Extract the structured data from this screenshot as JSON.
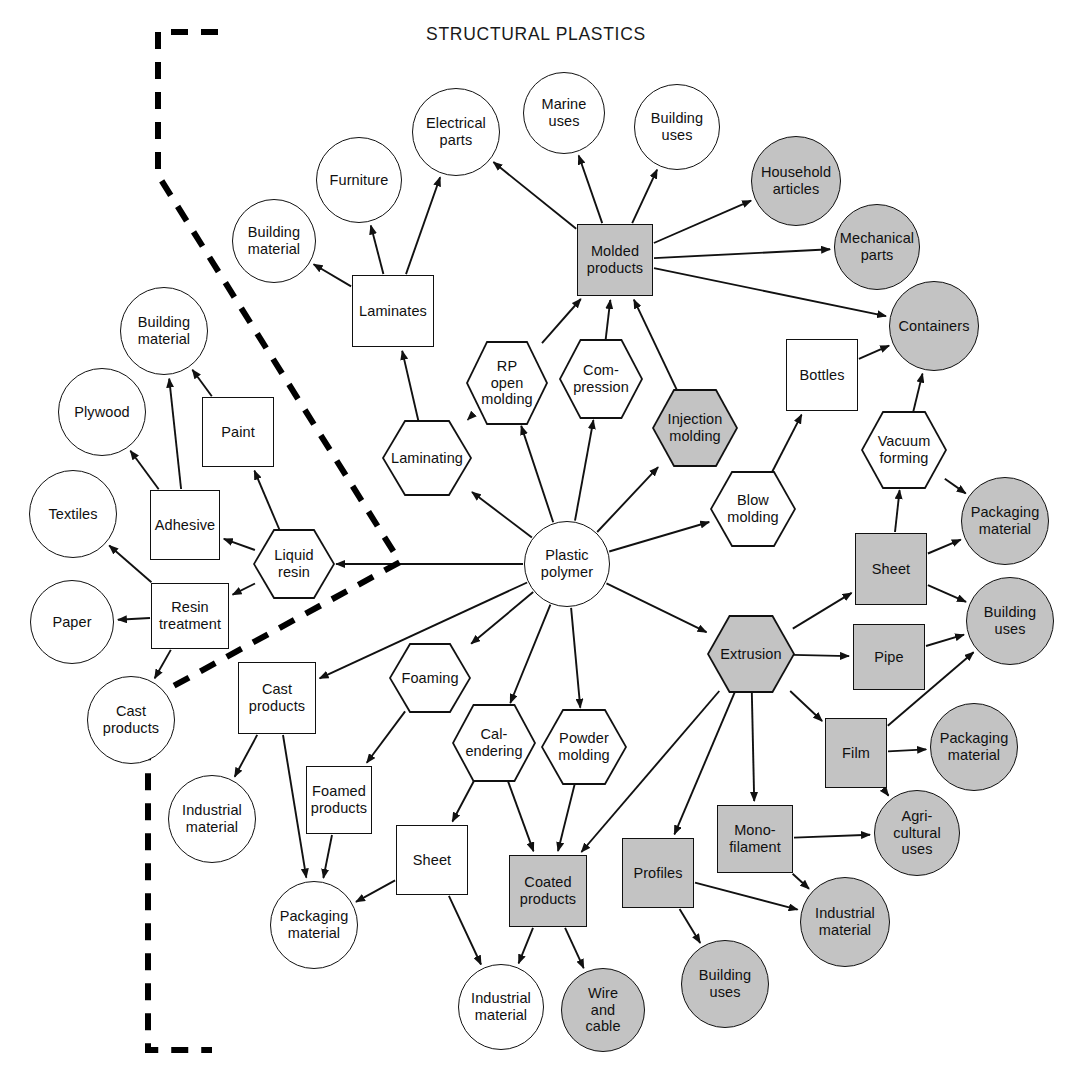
{
  "title": "STRUCTURAL PLASTICS",
  "colors": {
    "shaded_fill": "#c3c3c3",
    "plain_fill": "#ffffff",
    "stroke": "#111111",
    "boundary": "#000000"
  },
  "legend": {
    "shape_meanings": {
      "circle": "end use / application",
      "rectangle": "product form",
      "hexagon": "process"
    },
    "dashed_boundary_label": "dashed boundary line"
  },
  "nodes": [
    {
      "id": "building-material-top",
      "label": "Building\nmaterial",
      "shape": "circle",
      "shaded": false,
      "x": 232,
      "y": 199,
      "w": 84,
      "h": 84
    },
    {
      "id": "furniture",
      "label": "Furniture",
      "shape": "circle",
      "shaded": false,
      "x": 316,
      "y": 137,
      "w": 86,
      "h": 86
    },
    {
      "id": "electrical-parts",
      "label": "Electrical\nparts",
      "shape": "circle",
      "shaded": false,
      "x": 412,
      "y": 88,
      "w": 88,
      "h": 88
    },
    {
      "id": "marine-uses",
      "label": "Marine\nuses",
      "shape": "circle",
      "shaded": false,
      "x": 523,
      "y": 72,
      "w": 82,
      "h": 82
    },
    {
      "id": "building-uses-top",
      "label": "Building\nuses",
      "shape": "circle",
      "shaded": false,
      "x": 634,
      "y": 84,
      "w": 86,
      "h": 86
    },
    {
      "id": "household-articles",
      "label": "Household\narticles",
      "shape": "circle",
      "shaded": true,
      "x": 751,
      "y": 136,
      "w": 90,
      "h": 90
    },
    {
      "id": "mechanical-parts",
      "label": "Mechanical\nparts",
      "shape": "circle",
      "shaded": true,
      "x": 834,
      "y": 204,
      "w": 86,
      "h": 86
    },
    {
      "id": "containers",
      "label": "Containers",
      "shape": "circle",
      "shaded": true,
      "x": 889,
      "y": 281,
      "w": 90,
      "h": 90
    },
    {
      "id": "laminates",
      "label": "Laminates",
      "shape": "rect",
      "shaded": false,
      "x": 352,
      "y": 275,
      "w": 82,
      "h": 72
    },
    {
      "id": "molded-products",
      "label": "Molded\nproducts",
      "shape": "rect",
      "shaded": true,
      "x": 577,
      "y": 224,
      "w": 76,
      "h": 72
    },
    {
      "id": "bottles",
      "label": "Bottles",
      "shape": "rect",
      "shaded": false,
      "x": 786,
      "y": 339,
      "w": 72,
      "h": 72
    },
    {
      "id": "rp-open-molding",
      "label": "RP\nopen\nmolding",
      "shape": "hex",
      "shaded": false,
      "x": 466,
      "y": 341,
      "w": 82,
      "h": 84
    },
    {
      "id": "compression",
      "label": "Com-\npression",
      "shape": "hex",
      "shaded": false,
      "x": 559,
      "y": 339,
      "w": 84,
      "h": 80
    },
    {
      "id": "injection-molding",
      "label": "Injection\nmolding",
      "shape": "hex",
      "shaded": true,
      "x": 652,
      "y": 389,
      "w": 86,
      "h": 78
    },
    {
      "id": "laminating",
      "label": "Laminating",
      "shape": "hex",
      "shaded": false,
      "x": 382,
      "y": 420,
      "w": 90,
      "h": 76
    },
    {
      "id": "blow-molding",
      "label": "Blow\nmolding",
      "shape": "hex",
      "shaded": false,
      "x": 710,
      "y": 471,
      "w": 86,
      "h": 76
    },
    {
      "id": "vacuum-forming",
      "label": "Vacuum\nforming",
      "shape": "hex",
      "shaded": false,
      "x": 861,
      "y": 411,
      "w": 86,
      "h": 78
    },
    {
      "id": "building-material-left",
      "label": "Building\nmaterial",
      "shape": "circle",
      "shaded": false,
      "x": 120,
      "y": 287,
      "w": 88,
      "h": 88
    },
    {
      "id": "plywood",
      "label": "Plywood",
      "shape": "circle",
      "shaded": false,
      "x": 58,
      "y": 368,
      "w": 88,
      "h": 88
    },
    {
      "id": "paint",
      "label": "Paint",
      "shape": "rect",
      "shaded": false,
      "x": 202,
      "y": 397,
      "w": 72,
      "h": 70
    },
    {
      "id": "textiles",
      "label": "Textiles",
      "shape": "circle",
      "shaded": false,
      "x": 29,
      "y": 470,
      "w": 88,
      "h": 88
    },
    {
      "id": "adhesive",
      "label": "Adhesive",
      "shape": "rect",
      "shaded": false,
      "x": 150,
      "y": 490,
      "w": 70,
      "h": 70
    },
    {
      "id": "liquid-resin",
      "label": "Liquid\nresin",
      "shape": "hex",
      "shaded": false,
      "x": 253,
      "y": 529,
      "w": 82,
      "h": 70
    },
    {
      "id": "paper",
      "label": "Paper",
      "shape": "circle",
      "shaded": false,
      "x": 30,
      "y": 580,
      "w": 84,
      "h": 84
    },
    {
      "id": "resin-treatment",
      "label": "Resin\ntreatment",
      "shape": "rect",
      "shaded": false,
      "x": 151,
      "y": 583,
      "w": 78,
      "h": 66
    },
    {
      "id": "cast-products-circle",
      "label": "Cast\nproducts",
      "shape": "circle",
      "shaded": false,
      "x": 87,
      "y": 676,
      "w": 88,
      "h": 88
    },
    {
      "id": "plastic-polymer",
      "label": "Plastic\npolymer",
      "shape": "circle",
      "shaded": false,
      "x": 524,
      "y": 521,
      "w": 86,
      "h": 86
    },
    {
      "id": "cast-products-rect",
      "label": "Cast\nproducts",
      "shape": "rect",
      "shaded": false,
      "x": 238,
      "y": 662,
      "w": 78,
      "h": 72
    },
    {
      "id": "foaming",
      "label": "Foaming",
      "shape": "hex",
      "shaded": false,
      "x": 389,
      "y": 643,
      "w": 82,
      "h": 70
    },
    {
      "id": "calendering",
      "label": "Cal-\nendering",
      "shape": "hex",
      "shaded": false,
      "x": 452,
      "y": 704,
      "w": 84,
      "h": 78
    },
    {
      "id": "powder-molding",
      "label": "Powder\nmolding",
      "shape": "hex",
      "shaded": false,
      "x": 541,
      "y": 709,
      "w": 86,
      "h": 76
    },
    {
      "id": "industrial-material-left",
      "label": "Industrial\nmaterial",
      "shape": "circle",
      "shaded": false,
      "x": 168,
      "y": 775,
      "w": 88,
      "h": 88
    },
    {
      "id": "foamed-products",
      "label": "Foamed\nproducts",
      "shape": "rect",
      "shaded": false,
      "x": 306,
      "y": 766,
      "w": 66,
      "h": 68
    },
    {
      "id": "sheet-left",
      "label": "Sheet",
      "shape": "rect",
      "shaded": false,
      "x": 396,
      "y": 825,
      "w": 72,
      "h": 70
    },
    {
      "id": "coated-products",
      "label": "Coated\nproducts",
      "shape": "rect",
      "shaded": true,
      "x": 509,
      "y": 855,
      "w": 78,
      "h": 72
    },
    {
      "id": "packaging-material-left",
      "label": "Packaging\nmaterial",
      "shape": "circle",
      "shaded": false,
      "x": 270,
      "y": 881,
      "w": 88,
      "h": 88
    },
    {
      "id": "industrial-material-bottom",
      "label": "Industrial\nmaterial",
      "shape": "circle",
      "shaded": false,
      "x": 458,
      "y": 964,
      "w": 86,
      "h": 86
    },
    {
      "id": "wire-and-cable",
      "label": "Wire\nand\ncable",
      "shape": "circle",
      "shaded": true,
      "x": 561,
      "y": 968,
      "w": 84,
      "h": 84
    },
    {
      "id": "extrusion",
      "label": "Extrusion",
      "shape": "hex",
      "shaded": true,
      "x": 707,
      "y": 615,
      "w": 88,
      "h": 78
    },
    {
      "id": "sheet-right",
      "label": "Sheet",
      "shape": "rect",
      "shaded": true,
      "x": 855,
      "y": 533,
      "w": 72,
      "h": 72
    },
    {
      "id": "pipe",
      "label": "Pipe",
      "shape": "rect",
      "shaded": true,
      "x": 853,
      "y": 624,
      "w": 72,
      "h": 66
    },
    {
      "id": "film",
      "label": "Film",
      "shape": "rect",
      "shaded": true,
      "x": 825,
      "y": 718,
      "w": 62,
      "h": 70
    },
    {
      "id": "monofilament",
      "label": "Mono-\nfilament",
      "shape": "rect",
      "shaded": true,
      "x": 717,
      "y": 805,
      "w": 76,
      "h": 68
    },
    {
      "id": "profiles",
      "label": "Profiles",
      "shape": "rect",
      "shaded": true,
      "x": 622,
      "y": 838,
      "w": 72,
      "h": 70
    },
    {
      "id": "packaging-material-right",
      "label": "Packaging\nmaterial",
      "shape": "circle",
      "shaded": true,
      "x": 961,
      "y": 477,
      "w": 88,
      "h": 88
    },
    {
      "id": "building-uses-right",
      "label": "Building\nuses",
      "shape": "circle",
      "shaded": true,
      "x": 966,
      "y": 577,
      "w": 88,
      "h": 88
    },
    {
      "id": "packaging-material-film",
      "label": "Packaging\nmaterial",
      "shape": "circle",
      "shaded": true,
      "x": 930,
      "y": 703,
      "w": 88,
      "h": 88
    },
    {
      "id": "agricultural-uses",
      "label": "Agri-\ncultural\nuses",
      "shape": "circle",
      "shaded": true,
      "x": 874,
      "y": 790,
      "w": 86,
      "h": 86
    },
    {
      "id": "industrial-material-right",
      "label": "Industrial\nmaterial",
      "shape": "circle",
      "shaded": true,
      "x": 800,
      "y": 877,
      "w": 90,
      "h": 90
    },
    {
      "id": "building-uses-bottom",
      "label": "Building\nuses",
      "shape": "circle",
      "shaded": true,
      "x": 681,
      "y": 940,
      "w": 88,
      "h": 88
    }
  ],
  "edges": [
    {
      "from": "laminates",
      "to": "building-material-top"
    },
    {
      "from": "laminates",
      "to": "furniture"
    },
    {
      "from": "laminates",
      "to": "electrical-parts"
    },
    {
      "from": "laminating",
      "to": "laminates"
    },
    {
      "from": "rp-open-molding",
      "to": "laminating"
    },
    {
      "from": "plastic-polymer",
      "to": "laminating"
    },
    {
      "from": "plastic-polymer",
      "to": "rp-open-molding"
    },
    {
      "from": "plastic-polymer",
      "to": "compression"
    },
    {
      "from": "plastic-polymer",
      "to": "injection-molding"
    },
    {
      "from": "plastic-polymer",
      "to": "blow-molding"
    },
    {
      "from": "plastic-polymer",
      "to": "liquid-resin"
    },
    {
      "from": "plastic-polymer",
      "to": "cast-products-rect"
    },
    {
      "from": "plastic-polymer",
      "to": "foaming"
    },
    {
      "from": "plastic-polymer",
      "to": "calendering"
    },
    {
      "from": "plastic-polymer",
      "to": "powder-molding"
    },
    {
      "from": "plastic-polymer",
      "to": "extrusion"
    },
    {
      "from": "rp-open-molding",
      "to": "molded-products"
    },
    {
      "from": "compression",
      "to": "molded-products"
    },
    {
      "from": "injection-molding",
      "to": "molded-products"
    },
    {
      "from": "molded-products",
      "to": "marine-uses"
    },
    {
      "from": "molded-products",
      "to": "building-uses-top"
    },
    {
      "from": "molded-products",
      "to": "electrical-parts"
    },
    {
      "from": "molded-products",
      "to": "household-articles"
    },
    {
      "from": "molded-products",
      "to": "mechanical-parts"
    },
    {
      "from": "molded-products",
      "to": "containers"
    },
    {
      "from": "blow-molding",
      "to": "bottles"
    },
    {
      "from": "bottles",
      "to": "containers"
    },
    {
      "from": "vacuum-forming",
      "to": "containers"
    },
    {
      "from": "vacuum-forming",
      "to": "packaging-material-right"
    },
    {
      "from": "sheet-right",
      "to": "vacuum-forming"
    },
    {
      "from": "sheet-right",
      "to": "packaging-material-right"
    },
    {
      "from": "sheet-right",
      "to": "building-uses-right"
    },
    {
      "from": "extrusion",
      "to": "sheet-right"
    },
    {
      "from": "extrusion",
      "to": "pipe"
    },
    {
      "from": "extrusion",
      "to": "film"
    },
    {
      "from": "extrusion",
      "to": "monofilament"
    },
    {
      "from": "extrusion",
      "to": "profiles"
    },
    {
      "from": "extrusion",
      "to": "coated-products"
    },
    {
      "from": "pipe",
      "to": "building-uses-right"
    },
    {
      "from": "film",
      "to": "packaging-material-film"
    },
    {
      "from": "film",
      "to": "building-uses-right"
    },
    {
      "from": "film",
      "to": "agricultural-uses"
    },
    {
      "from": "monofilament",
      "to": "agricultural-uses"
    },
    {
      "from": "monofilament",
      "to": "industrial-material-right"
    },
    {
      "from": "profiles",
      "to": "industrial-material-right"
    },
    {
      "from": "profiles",
      "to": "building-uses-bottom"
    },
    {
      "from": "liquid-resin",
      "to": "adhesive"
    },
    {
      "from": "liquid-resin",
      "to": "paint"
    },
    {
      "from": "liquid-resin",
      "to": "resin-treatment"
    },
    {
      "from": "paint",
      "to": "building-material-left"
    },
    {
      "from": "adhesive",
      "to": "building-material-left"
    },
    {
      "from": "adhesive",
      "to": "plywood"
    },
    {
      "from": "resin-treatment",
      "to": "textiles"
    },
    {
      "from": "resin-treatment",
      "to": "paper"
    },
    {
      "from": "resin-treatment",
      "to": "cast-products-circle"
    },
    {
      "from": "cast-products-rect",
      "to": "industrial-material-left"
    },
    {
      "from": "cast-products-rect",
      "to": "packaging-material-left"
    },
    {
      "from": "foaming",
      "to": "foamed-products"
    },
    {
      "from": "foamed-products",
      "to": "packaging-material-left"
    },
    {
      "from": "calendering",
      "to": "sheet-left"
    },
    {
      "from": "calendering",
      "to": "coated-products"
    },
    {
      "from": "powder-molding",
      "to": "coated-products"
    },
    {
      "from": "sheet-left",
      "to": "packaging-material-left"
    },
    {
      "from": "sheet-left",
      "to": "industrial-material-bottom"
    },
    {
      "from": "coated-products",
      "to": "industrial-material-bottom"
    },
    {
      "from": "coated-products",
      "to": "wire-and-cable"
    }
  ]
}
